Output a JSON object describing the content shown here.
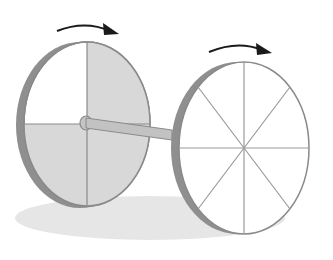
{
  "figure": {
    "colors": {
      "background": "#ffffff",
      "rim": "#8a8a8a",
      "rim_light": "#a8a8a8",
      "spoke": "#9a9a9a",
      "shaded_quadrant": "#d6d6d6",
      "shadow": "#e4e4e4",
      "arrow": "#1a1a1a",
      "axle": "#bdbdbd"
    },
    "left_wheel": {
      "type": "solid disk",
      "divisions": 4,
      "shaded_quadrants": [
        "top-right",
        "bottom-left",
        "bottom-right"
      ]
    },
    "right_wheel": {
      "type": "spoked wheel",
      "spokes": 8
    },
    "arrows": [
      {
        "position": "above left wheel",
        "direction": "clockwise"
      },
      {
        "position": "above right wheel",
        "direction": "clockwise"
      }
    ]
  }
}
